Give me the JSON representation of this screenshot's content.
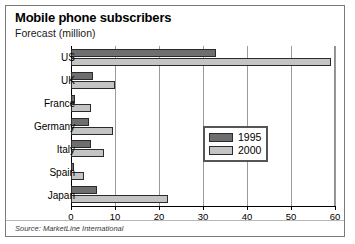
{
  "figure": {
    "title": "Mobile phone subscribers",
    "subtitle": "Forecast (million)",
    "source": "Source: MarketLine International"
  },
  "legend": {
    "items": [
      {
        "label": "1995",
        "color": "#6e6e6e"
      },
      {
        "label": "2000",
        "color": "#c4c4c4"
      }
    ]
  },
  "axis": {
    "ticks": [
      "0",
      "10",
      "20",
      "30",
      "40",
      "50",
      "60"
    ]
  },
  "chart_data": {
    "type": "bar",
    "orientation": "horizontal",
    "title": "Mobile phone subscribers",
    "subtitle": "Forecast (million)",
    "xlabel": "",
    "ylabel": "",
    "xlim": [
      0,
      60
    ],
    "xticks": [
      0,
      10,
      20,
      30,
      40,
      50,
      60
    ],
    "grid": true,
    "legend_position": "center-right",
    "source": "Source: MarketLine International",
    "categories": [
      "US",
      "UK",
      "France",
      "Germany",
      "Italy",
      "Spain",
      "Japan"
    ],
    "series": [
      {
        "name": "1995",
        "color": "#6e6e6e",
        "values": [
          33,
          5,
          1,
          4,
          4.5,
          0.7,
          6
        ]
      },
      {
        "name": "2000",
        "color": "#c4c4c4",
        "values": [
          59,
          10,
          4.5,
          9.5,
          7.5,
          3,
          22
        ]
      }
    ]
  }
}
